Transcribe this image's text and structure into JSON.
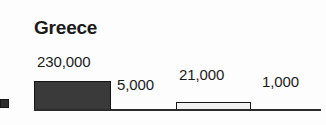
{
  "chart_data": {
    "type": "bar",
    "title": "Greece",
    "subtitle": "",
    "xlabel": "",
    "ylabel": "",
    "categories": [
      "",
      "",
      "",
      ""
    ],
    "values": [
      230000,
      5000,
      21000,
      1000
    ],
    "data_labels": [
      "230,000",
      "5,000",
      "21,000",
      "1,000"
    ],
    "series": [
      {
        "name": "",
        "values": [
          230000,
          5000,
          21000,
          1000
        ]
      }
    ],
    "ylim": [
      0,
      230000
    ],
    "grid": false,
    "legend": "none",
    "bar_styles": [
      "filled-dark",
      "zero-height",
      "filled-light",
      "zero-height"
    ],
    "axis_line_color": "#2b2b2b",
    "bar_fill_dark": "#3a3a3a",
    "bar_fill_light": "#f2f2f2",
    "bar_stroke": "#141414"
  },
  "chart": {
    "title": "Greece",
    "bars": [
      {
        "label": "230,000",
        "value": 230000
      },
      {
        "label": "5,000",
        "value": 5000
      },
      {
        "label": "21,000",
        "value": 21000
      },
      {
        "label": "1,000",
        "value": 1000
      }
    ]
  }
}
